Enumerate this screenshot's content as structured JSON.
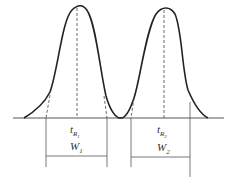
{
  "diagram": {
    "type": "chromatogram",
    "colors": {
      "curve": "#222222",
      "lines": "#444444",
      "background": "#ffffff"
    },
    "peaks": [
      {
        "retention_label": {
          "main": "t",
          "sub": "R",
          "subsub": "1"
        },
        "width_label": {
          "main": "W",
          "sub": "1"
        }
      },
      {
        "retention_label": {
          "main": "t",
          "sub": "R",
          "subsub": "2"
        },
        "width_label": {
          "main": "W",
          "sub": "2"
        }
      }
    ]
  }
}
